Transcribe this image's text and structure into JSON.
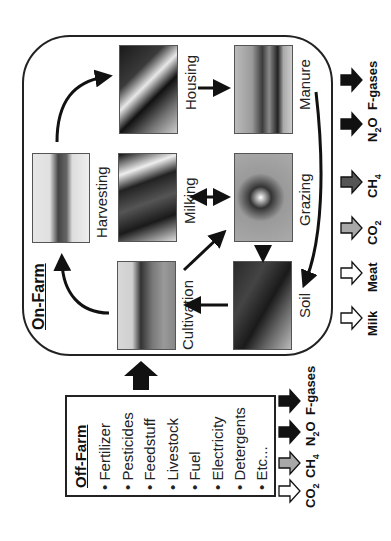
{
  "on_farm": {
    "title": "On-Farm",
    "stages": [
      {
        "id": "housing",
        "label": "Housing"
      },
      {
        "id": "manure",
        "label": "Manure"
      },
      {
        "id": "harvesting",
        "label": "Harvesting"
      },
      {
        "id": "milking",
        "label": "Milking"
      },
      {
        "id": "grazing",
        "label": "Grazing"
      },
      {
        "id": "cultivation",
        "label": "Cultivation"
      },
      {
        "id": "soil",
        "label": "Soil"
      }
    ],
    "outputs": [
      {
        "label": "Milk",
        "arrow_fill": "#ffffff"
      },
      {
        "label": "Meat",
        "arrow_fill": "#ffffff"
      },
      {
        "label_main": "CO",
        "label_sub": "2",
        "arrow_fill": "#a8a8a8"
      },
      {
        "label_main": "CH",
        "label_sub": "4",
        "arrow_fill": "#555555"
      },
      {
        "label_main": "N",
        "label_sub": "2",
        "label_tail": "O",
        "arrow_fill": "#111111"
      },
      {
        "label": "F-gases",
        "arrow_fill": "#111111"
      }
    ]
  },
  "off_farm": {
    "title": "Off-Farm",
    "items": [
      "Fertilizer",
      "Pesticides",
      "Feedstuff",
      "Livestock",
      "Fuel",
      "Electricity",
      "Detergents",
      "Etc..."
    ],
    "bullet": "•",
    "outputs": [
      {
        "label_main": "CO",
        "label_sub": "2",
        "arrow_fill": "#ffffff"
      },
      {
        "label_main": "CH",
        "label_sub": "4",
        "arrow_fill": "#a8a8a8"
      },
      {
        "label_main": "N",
        "label_sub": "2",
        "label_tail": "O",
        "arrow_fill": "#111111"
      },
      {
        "label": "F-gases",
        "arrow_fill": "#111111"
      }
    ]
  }
}
